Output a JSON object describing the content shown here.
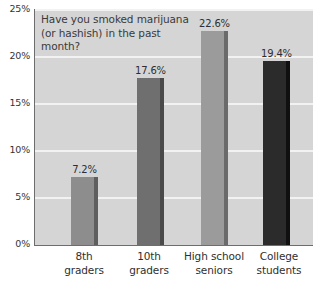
{
  "chart_data": {
    "type": "bar",
    "title": "Have you smoked marijuana (or hashish) in the past month?",
    "title_lines": [
      "Have you smoked marijuana",
      "(or hashish) in the past",
      "month?"
    ],
    "xlabel": "",
    "ylabel": "",
    "ylim": [
      0,
      25
    ],
    "grid": true,
    "legend": "none",
    "y_ticks": [
      "0%",
      "5%",
      "10%",
      "15%",
      "20%",
      "25%"
    ],
    "y_tick_values": [
      0,
      5,
      10,
      15,
      20,
      25
    ],
    "categories": [
      "8th graders",
      "10th graders",
      "High school seniors",
      "College students"
    ],
    "category_lines": [
      [
        "8th",
        "graders"
      ],
      [
        "10th",
        "graders"
      ],
      [
        "High school",
        "seniors"
      ],
      [
        "College",
        "students"
      ]
    ],
    "values": [
      7.2,
      17.6,
      22.6,
      19.4
    ],
    "value_labels": [
      "7.2%",
      "17.6%",
      "22.6%",
      "19.4%"
    ],
    "bar_colors": [
      "#8d8d8d",
      "#6f6f6f",
      "#9b9b9b",
      "#2b2b2b"
    ],
    "bar_edge_colors": [
      "#5e5e5e",
      "#4a4a4a",
      "#6a6a6a",
      "#101010"
    ]
  },
  "colors": {
    "plot_background": "#d5d5d5",
    "page_background": "#ffffff",
    "gridline": "#f2f2f2",
    "axis_line": "#6d6d6d",
    "text": "#2e2e2e"
  }
}
